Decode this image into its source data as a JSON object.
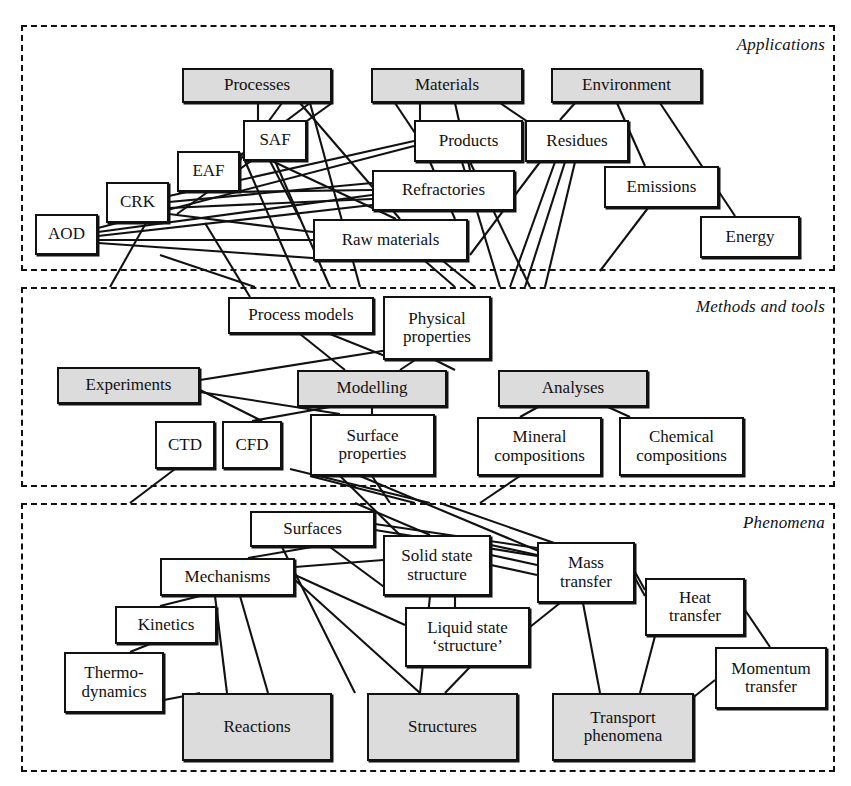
{
  "colors": {
    "shaded_fill": "#dcdcdc",
    "plain_fill": "#ffffff",
    "stroke": "#111111"
  },
  "sections": [
    {
      "id": "applications",
      "label": "Applications",
      "x": 21,
      "y": 25,
      "w": 814,
      "h": 246
    },
    {
      "id": "methods",
      "label": "Methods and tools",
      "x": 21,
      "y": 287,
      "w": 814,
      "h": 200
    },
    {
      "id": "phenomena",
      "label": "Phenomena",
      "x": 21,
      "y": 503,
      "w": 814,
      "h": 269
    }
  ],
  "nodes": [
    {
      "id": "processes",
      "label": "Processes",
      "x": 182,
      "y": 68,
      "w": 150,
      "h": 35,
      "shaded": true,
      "section": "applications"
    },
    {
      "id": "materials",
      "label": "Materials",
      "x": 371,
      "y": 68,
      "w": 152,
      "h": 35,
      "shaded": true,
      "section": "applications"
    },
    {
      "id": "environment",
      "label": "Environment",
      "x": 551,
      "y": 68,
      "w": 151,
      "h": 35,
      "shaded": true,
      "section": "applications"
    },
    {
      "id": "saf",
      "label": "SAF",
      "x": 243,
      "y": 120,
      "w": 64,
      "h": 41,
      "shaded": false,
      "section": "applications"
    },
    {
      "id": "eaf",
      "label": "EAF",
      "x": 177,
      "y": 151,
      "w": 63,
      "h": 41,
      "shaded": false,
      "section": "applications"
    },
    {
      "id": "crk",
      "label": "CRK",
      "x": 106,
      "y": 182,
      "w": 63,
      "h": 41,
      "shaded": false,
      "section": "applications"
    },
    {
      "id": "aod",
      "label": "AOD",
      "x": 35,
      "y": 214,
      "w": 63,
      "h": 41,
      "shaded": false,
      "section": "applications"
    },
    {
      "id": "products",
      "label": "Products",
      "x": 414,
      "y": 120,
      "w": 109,
      "h": 42,
      "shaded": false,
      "section": "applications"
    },
    {
      "id": "residues",
      "label": "Residues",
      "x": 525,
      "y": 120,
      "w": 104,
      "h": 42,
      "shaded": false,
      "section": "applications"
    },
    {
      "id": "refractories",
      "label": "Refractories",
      "x": 372,
      "y": 170,
      "w": 143,
      "h": 41,
      "shaded": false,
      "section": "applications"
    },
    {
      "id": "rawmaterials",
      "label": "Raw materials",
      "x": 313,
      "y": 219,
      "w": 155,
      "h": 42,
      "shaded": false,
      "section": "applications"
    },
    {
      "id": "emissions",
      "label": "Emissions",
      "x": 604,
      "y": 166,
      "w": 115,
      "h": 42,
      "shaded": false,
      "section": "applications"
    },
    {
      "id": "energy",
      "label": "Energy",
      "x": 700,
      "y": 216,
      "w": 100,
      "h": 42,
      "shaded": false,
      "section": "applications"
    },
    {
      "id": "processmodels",
      "label": "Process models",
      "x": 228,
      "y": 297,
      "w": 146,
      "h": 37,
      "shaded": false,
      "section": "methods"
    },
    {
      "id": "physicalprops",
      "label": "Physical\nproperties",
      "x": 383,
      "y": 296,
      "w": 108,
      "h": 64,
      "shaded": false,
      "section": "methods"
    },
    {
      "id": "experiments",
      "label": "Experiments",
      "x": 57,
      "y": 367,
      "w": 143,
      "h": 37,
      "shaded": true,
      "section": "methods"
    },
    {
      "id": "modelling",
      "label": "Modelling",
      "x": 297,
      "y": 370,
      "w": 150,
      "h": 37,
      "shaded": true,
      "section": "methods"
    },
    {
      "id": "analyses",
      "label": "Analyses",
      "x": 498,
      "y": 370,
      "w": 150,
      "h": 37,
      "shaded": true,
      "section": "methods"
    },
    {
      "id": "ctd",
      "label": "CTD",
      "x": 155,
      "y": 421,
      "w": 60,
      "h": 48,
      "shaded": false,
      "section": "methods"
    },
    {
      "id": "cfd",
      "label": "CFD",
      "x": 222,
      "y": 421,
      "w": 60,
      "h": 48,
      "shaded": false,
      "section": "methods"
    },
    {
      "id": "surfaceprops",
      "label": "Surface\nproperties",
      "x": 310,
      "y": 414,
      "w": 125,
      "h": 62,
      "shaded": false,
      "section": "methods"
    },
    {
      "id": "mineralcomp",
      "label": "Mineral\ncompositions",
      "x": 477,
      "y": 417,
      "w": 125,
      "h": 59,
      "shaded": false,
      "section": "methods"
    },
    {
      "id": "chemicalcomp",
      "label": "Chemical\ncompositions",
      "x": 619,
      "y": 417,
      "w": 125,
      "h": 59,
      "shaded": false,
      "section": "methods"
    },
    {
      "id": "surfaces",
      "label": "Surfaces",
      "x": 250,
      "y": 511,
      "w": 125,
      "h": 36,
      "shaded": false,
      "section": "phenomena"
    },
    {
      "id": "solidstate",
      "label": "Solid state\nstructure",
      "x": 383,
      "y": 535,
      "w": 108,
      "h": 61,
      "shaded": false,
      "section": "phenomena"
    },
    {
      "id": "masstransfer",
      "label": "Mass\ntransfer",
      "x": 537,
      "y": 542,
      "w": 98,
      "h": 61,
      "shaded": false,
      "section": "phenomena"
    },
    {
      "id": "mechanisms",
      "label": "Mechanisms",
      "x": 160,
      "y": 558,
      "w": 135,
      "h": 38,
      "shaded": false,
      "section": "phenomena"
    },
    {
      "id": "heattransfer",
      "label": "Heat\ntransfer",
      "x": 645,
      "y": 578,
      "w": 100,
      "h": 58,
      "shaded": false,
      "section": "phenomena"
    },
    {
      "id": "liquidstate",
      "label": "Liquid state\n‘structure’",
      "x": 405,
      "y": 607,
      "w": 125,
      "h": 60,
      "shaded": false,
      "section": "phenomena"
    },
    {
      "id": "kinetics",
      "label": "Kinetics",
      "x": 115,
      "y": 606,
      "w": 102,
      "h": 38,
      "shaded": false,
      "section": "phenomena"
    },
    {
      "id": "momentum",
      "label": "Momentum\ntransfer",
      "x": 715,
      "y": 647,
      "w": 112,
      "h": 62,
      "shaded": false,
      "section": "phenomena"
    },
    {
      "id": "thermodynamics",
      "label": "Thermo-\ndynamics",
      "x": 64,
      "y": 652,
      "w": 100,
      "h": 61,
      "shaded": false,
      "section": "phenomena"
    },
    {
      "id": "reactions",
      "label": "Reactions",
      "x": 182,
      "y": 693,
      "w": 150,
      "h": 68,
      "shaded": true,
      "section": "phenomena"
    },
    {
      "id": "structures",
      "label": "Structures",
      "x": 367,
      "y": 693,
      "w": 151,
      "h": 68,
      "shaded": true,
      "section": "phenomena"
    },
    {
      "id": "transport",
      "label": "Transport\nphenomena",
      "x": 552,
      "y": 693,
      "w": 142,
      "h": 68,
      "shaded": true,
      "section": "phenomena"
    }
  ],
  "edges": [
    [
      332,
      103,
      177,
      214
    ],
    [
      310,
      103,
      205,
      182
    ],
    [
      282,
      103,
      238,
      163
    ],
    [
      258,
      103,
      258,
      120
    ],
    [
      300,
      103,
      400,
      219
    ],
    [
      270,
      161,
      300,
      219
    ],
    [
      272,
      161,
      396,
      219
    ],
    [
      230,
      192,
      372,
      190
    ],
    [
      169,
      196,
      414,
      141
    ],
    [
      169,
      202,
      372,
      183
    ],
    [
      169,
      208,
      372,
      199
    ],
    [
      169,
      214,
      313,
      232
    ],
    [
      98,
      228,
      414,
      146
    ],
    [
      98,
      232,
      372,
      195
    ],
    [
      98,
      236,
      372,
      205
    ],
    [
      98,
      240,
      313,
      240
    ],
    [
      98,
      243,
      355,
      261
    ],
    [
      146,
      223,
      110,
      287
    ],
    [
      205,
      223,
      250,
      297
    ],
    [
      160,
      255,
      255,
      287
    ],
    [
      245,
      161,
      300,
      287
    ],
    [
      275,
      161,
      330,
      287
    ],
    [
      310,
      103,
      360,
      287
    ],
    [
      395,
      103,
      415,
      133
    ],
    [
      420,
      103,
      420,
      120
    ],
    [
      455,
      103,
      470,
      170
    ],
    [
      500,
      103,
      540,
      130
    ],
    [
      430,
      162,
      455,
      219
    ],
    [
      462,
      162,
      500,
      287
    ],
    [
      470,
      162,
      530,
      287
    ],
    [
      555,
      162,
      510,
      287
    ],
    [
      565,
      162,
      525,
      287
    ],
    [
      575,
      162,
      545,
      287
    ],
    [
      540,
      162,
      470,
      255
    ],
    [
      575,
      103,
      560,
      120
    ],
    [
      617,
      103,
      645,
      166
    ],
    [
      660,
      103,
      735,
      216
    ],
    [
      648,
      208,
      600,
      271
    ],
    [
      443,
      261,
      475,
      287
    ],
    [
      425,
      261,
      455,
      287
    ],
    [
      300,
      334,
      345,
      370
    ],
    [
      330,
      334,
      395,
      360
    ],
    [
      200,
      380,
      420,
      345
    ],
    [
      200,
      390,
      262,
      421
    ],
    [
      200,
      392,
      340,
      414
    ],
    [
      372,
      407,
      372,
      414
    ],
    [
      330,
      407,
      252,
      421
    ],
    [
      435,
      360,
      455,
      370
    ],
    [
      415,
      360,
      400,
      370
    ],
    [
      538,
      407,
      520,
      417
    ],
    [
      608,
      407,
      630,
      417
    ],
    [
      175,
      469,
      130,
      503
    ],
    [
      340,
      476,
      400,
      535
    ],
    [
      360,
      476,
      560,
      560
    ],
    [
      290,
      469,
      430,
      503
    ],
    [
      310,
      476,
      415,
      503
    ],
    [
      520,
      476,
      480,
      503
    ],
    [
      372,
      476,
      390,
      503
    ],
    [
      312,
      547,
      248,
      558
    ],
    [
      330,
      547,
      395,
      595
    ],
    [
      295,
      567,
      383,
      560
    ],
    [
      295,
      575,
      405,
      625
    ],
    [
      282,
      547,
      355,
      693
    ],
    [
      295,
      580,
      420,
      693
    ],
    [
      215,
      596,
      227,
      693
    ],
    [
      240,
      596,
      268,
      693
    ],
    [
      200,
      596,
      160,
      606
    ],
    [
      150,
      644,
      130,
      652
    ],
    [
      164,
      700,
      200,
      693
    ],
    [
      430,
      596,
      420,
      693
    ],
    [
      455,
      596,
      455,
      607
    ],
    [
      470,
      667,
      445,
      693
    ],
    [
      491,
      545,
      537,
      555
    ],
    [
      491,
      555,
      537,
      565
    ],
    [
      491,
      565,
      537,
      575
    ],
    [
      530,
      627,
      560,
      603
    ],
    [
      583,
      603,
      600,
      693
    ],
    [
      635,
      572,
      645,
      590
    ],
    [
      635,
      578,
      645,
      596
    ],
    [
      655,
      636,
      640,
      693
    ],
    [
      745,
      610,
      770,
      647
    ],
    [
      715,
      680,
      690,
      700
    ],
    [
      375,
      524,
      537,
      548
    ],
    [
      375,
      530,
      537,
      556
    ],
    [
      440,
      503,
      560,
      545
    ],
    [
      355,
      503,
      430,
      535
    ]
  ]
}
